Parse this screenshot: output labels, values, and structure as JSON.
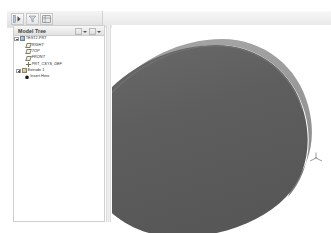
{
  "app": {
    "title": "Model Tree",
    "accent_color": "#6f6f6f",
    "model_face_color": "#5f5f5f",
    "model_edge_color": "#8c8c8c",
    "panel_bg": "#ffffff"
  },
  "toolbar": {
    "buttons": [
      {
        "name": "show-tree-button",
        "icon": "panel-show-icon",
        "label": ""
      },
      {
        "name": "filter-button",
        "icon": "filter-icon",
        "label": ""
      },
      {
        "name": "settings-button",
        "icon": "grid-settings-icon",
        "label": ""
      }
    ]
  },
  "tree_header": {
    "title": "Model Tree",
    "buttons": [
      {
        "name": "tree-filter-menu",
        "icon": "filter-dropdown-icon"
      },
      {
        "name": "tree-settings-menu",
        "icon": "settings-dropdown-icon"
      }
    ]
  },
  "tree": {
    "items": [
      {
        "label": "TEST2.PRT",
        "icon": "part-icon",
        "indent": 0,
        "toggle": "minus",
        "italic": false
      },
      {
        "label": "RIGHT",
        "icon": "plane-icon",
        "indent": 1,
        "toggle": "none",
        "italic": true
      },
      {
        "label": "TOP",
        "icon": "plane-icon",
        "indent": 1,
        "toggle": "none",
        "italic": true
      },
      {
        "label": "FRONT",
        "icon": "plane-icon",
        "indent": 1,
        "toggle": "none",
        "italic": true
      },
      {
        "label": "PRT_CSYS_DEF",
        "icon": "csys-icon",
        "indent": 1,
        "toggle": "none",
        "italic": true
      },
      {
        "label": "Extrude 1",
        "icon": "feature-icon",
        "indent": 1,
        "toggle": "plus",
        "italic": false
      },
      {
        "label": "Insert Here",
        "icon": "insert-icon",
        "indent": 2,
        "toggle": "none",
        "italic": false
      }
    ]
  },
  "viewport": {
    "name": "graphics-window",
    "model_name": "TEST2.PRT",
    "csys_marker": "datum-csys-marker"
  }
}
